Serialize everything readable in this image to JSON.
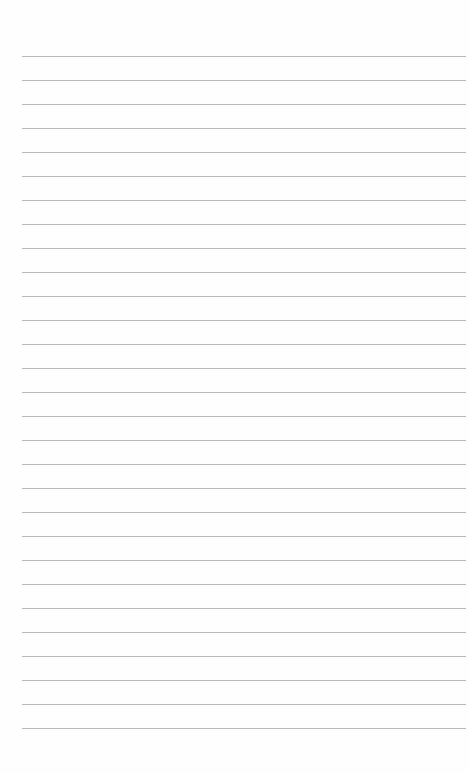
{
  "page": {
    "type": "lined-paper",
    "line_count": 29,
    "first_line_y": 56,
    "line_spacing": 24.0,
    "line_left": 22,
    "line_width": 444,
    "line_color": "#b9b9b9",
    "background_color": "#fefefe"
  }
}
